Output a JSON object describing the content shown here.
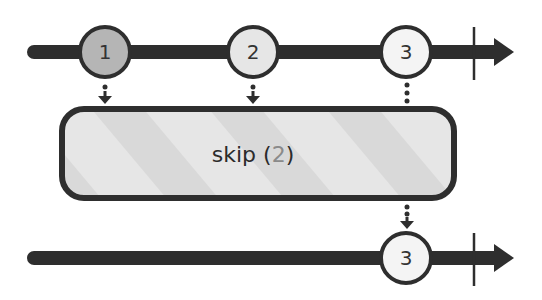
{
  "diagram": {
    "type": "marble-diagram",
    "operator": {
      "name": "skip",
      "open_paren": "(",
      "argument": "2",
      "close_paren": ")"
    },
    "input_stream": {
      "marbles": [
        {
          "label": "1",
          "fill": "#b5b5b5"
        },
        {
          "label": "2",
          "fill": "#e6e6e6"
        },
        {
          "label": "3",
          "fill": "#f4f4f4"
        }
      ],
      "completed": true
    },
    "output_stream": {
      "marbles": [
        {
          "label": "3",
          "fill": "#f4f4f4"
        }
      ],
      "completed": true
    },
    "colors": {
      "line": "#2e2e2e",
      "box_fill": "#e4e4e4",
      "box_stripe": "#d6d6d6",
      "box_border": "#2e2e2e"
    }
  }
}
